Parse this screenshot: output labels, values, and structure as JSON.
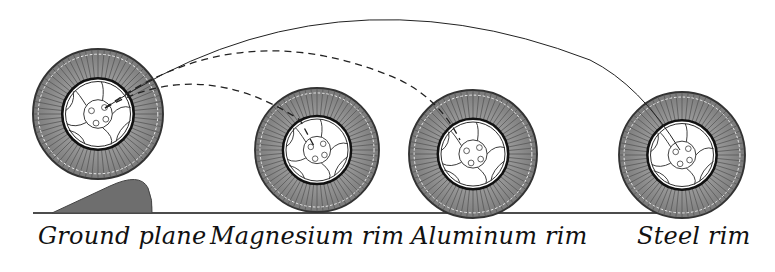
{
  "diagram": {
    "labels": [
      {
        "id": "ground",
        "text": "Ground plane"
      },
      {
        "id": "magnesium",
        "text": "Magnesium rim"
      },
      {
        "id": "aluminum",
        "text": "Aluminum rim"
      },
      {
        "id": "steel",
        "text": "Steel rim"
      }
    ],
    "wheels": [
      {
        "name": "ground-wheel",
        "cx": 98,
        "cy": 114,
        "r": 65
      },
      {
        "name": "magnesium-wheel",
        "cx": 317,
        "cy": 150,
        "r": 62
      },
      {
        "name": "aluminum-wheel",
        "cx": 473,
        "cy": 154,
        "r": 64
      },
      {
        "name": "steel-wheel",
        "cx": 682,
        "cy": 155,
        "r": 63
      }
    ],
    "trajectories": [
      {
        "to": "magnesium",
        "style": "dashed"
      },
      {
        "to": "aluminum",
        "style": "dashed"
      },
      {
        "to": "steel",
        "style": "solid"
      }
    ],
    "colors": {
      "tire": "#8a8a8a",
      "bump": "#6e6e6e",
      "line": "#111111"
    }
  }
}
